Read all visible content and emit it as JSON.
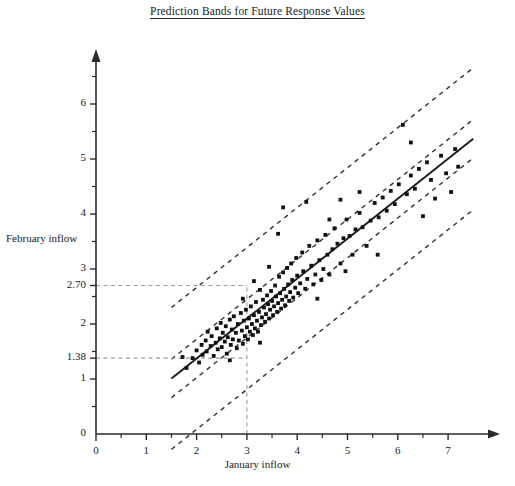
{
  "chart_data": {
    "type": "scatter",
    "title": "Prediction Bands for Future Response Values",
    "xlabel": "January inflow",
    "ylabel": "February inflow",
    "xlim": [
      0,
      7.6
    ],
    "ylim": [
      0,
      6.6
    ],
    "xticks": [
      0,
      1,
      2,
      3,
      4,
      5,
      6,
      7
    ],
    "xticklabels": [
      "0",
      "1",
      "2",
      "3",
      "4",
      "5",
      "6",
      "7"
    ],
    "xminor_ticks": [
      0.5,
      1.5,
      2.5,
      3.5,
      4.5,
      5.5,
      6.5
    ],
    "yticks": [
      0,
      1,
      2,
      3,
      4,
      5,
      6
    ],
    "yticklabels": [
      "0",
      "1",
      "2",
      "3",
      "4",
      "5",
      "6"
    ],
    "yminor_ticks": [
      0.5,
      1.5,
      2.5,
      3.5,
      4.5,
      5.5,
      6.5
    ],
    "grid": false,
    "legend": null,
    "annotations": [
      {
        "name": "upper-prediction-value",
        "label": "2.70",
        "y": 2.7,
        "x": 3.0
      },
      {
        "name": "lower-prediction-value",
        "label": "1.38",
        "y": 1.38,
        "x": 3.0
      },
      {
        "name": "query-x-value",
        "label": "3",
        "x": 3.0
      }
    ],
    "guide_lines": [
      {
        "name": "horizontal-guide-270",
        "type": "horizontal",
        "y": 2.7,
        "x_from": 0,
        "x_to": 3.0,
        "style": "dashed"
      },
      {
        "name": "horizontal-guide-138",
        "type": "horizontal",
        "y": 1.38,
        "x_from": 0,
        "x_to": 3.0,
        "style": "dashed"
      },
      {
        "name": "vertical-guide-3",
        "type": "vertical",
        "x": 3.0,
        "y_from": 0,
        "y_to": 2.7,
        "style": "dashed"
      }
    ],
    "fit_line": {
      "name": "regression-line",
      "style": "solid",
      "slope": 0.7262,
      "intercept": -0.0786,
      "x_from": 1.5,
      "x_to": 7.5,
      "y_from": 1.01,
      "y_to": 5.37
    },
    "bands": [
      {
        "name": "confidence-band-upper",
        "style": "dashed",
        "slope": 0.7262,
        "intercept": 0.2714,
        "x_from": 1.5,
        "x_to": 7.5
      },
      {
        "name": "confidence-band-lower",
        "style": "dashed",
        "slope": 0.7262,
        "intercept": -0.4286,
        "x_from": 1.5,
        "x_to": 7.5
      },
      {
        "name": "prediction-band-upper",
        "style": "dashed",
        "slope": 0.7262,
        "intercept": 1.2114,
        "x_from": 1.5,
        "x_to": 7.5
      },
      {
        "name": "prediction-band-lower",
        "style": "dashed",
        "slope": 0.7262,
        "intercept": -1.3686,
        "x_from": 1.5,
        "x_to": 7.5
      }
    ],
    "points": [
      [
        1.72,
        1.4
      ],
      [
        1.8,
        1.2
      ],
      [
        1.92,
        1.38
      ],
      [
        2.0,
        1.52
      ],
      [
        2.05,
        1.3
      ],
      [
        2.1,
        1.62
      ],
      [
        2.12,
        1.44
      ],
      [
        2.18,
        1.7
      ],
      [
        2.2,
        1.5
      ],
      [
        2.22,
        1.86
      ],
      [
        2.28,
        1.6
      ],
      [
        2.3,
        1.78
      ],
      [
        2.34,
        1.42
      ],
      [
        2.38,
        1.66
      ],
      [
        2.4,
        1.92
      ],
      [
        2.42,
        1.54
      ],
      [
        2.46,
        1.74
      ],
      [
        2.48,
        2.02
      ],
      [
        2.5,
        1.58
      ],
      [
        2.52,
        1.84
      ],
      [
        2.56,
        1.68
      ],
      [
        2.58,
        1.96
      ],
      [
        2.6,
        1.46
      ],
      [
        2.62,
        1.76
      ],
      [
        2.66,
        2.08
      ],
      [
        2.68,
        1.62
      ],
      [
        2.7,
        1.9
      ],
      [
        2.72,
        1.72
      ],
      [
        2.74,
        2.14
      ],
      [
        2.78,
        1.84
      ],
      [
        2.8,
        1.56
      ],
      [
        2.82,
        2.0
      ],
      [
        2.84,
        1.7
      ],
      [
        2.88,
        2.2
      ],
      [
        2.9,
        1.88
      ],
      [
        2.92,
        1.64
      ],
      [
        2.94,
        2.06
      ],
      [
        2.96,
        1.78
      ],
      [
        2.98,
        2.26
      ],
      [
        3.0,
        1.94
      ],
      [
        3.02,
        1.72
      ],
      [
        3.04,
        2.1
      ],
      [
        3.06,
        1.86
      ],
      [
        3.08,
        2.32
      ],
      [
        3.1,
        2.0
      ],
      [
        3.12,
        1.8
      ],
      [
        3.14,
        2.16
      ],
      [
        3.16,
        1.92
      ],
      [
        3.18,
        2.4
      ],
      [
        3.2,
        2.06
      ],
      [
        3.22,
        1.86
      ],
      [
        3.24,
        2.22
      ],
      [
        3.26,
        2.62
      ],
      [
        3.28,
        1.98
      ],
      [
        3.3,
        2.12
      ],
      [
        3.32,
        2.44
      ],
      [
        3.34,
        2.3
      ],
      [
        3.36,
        2.04
      ],
      [
        3.38,
        2.18
      ],
      [
        3.4,
        2.52
      ],
      [
        3.42,
        2.36
      ],
      [
        3.44,
        2.1
      ],
      [
        3.46,
        2.26
      ],
      [
        3.48,
        2.6
      ],
      [
        3.5,
        2.42
      ],
      [
        3.52,
        2.16
      ],
      [
        3.54,
        2.32
      ],
      [
        3.56,
        2.7
      ],
      [
        3.58,
        2.5
      ],
      [
        3.6,
        2.22
      ],
      [
        3.62,
        2.38
      ],
      [
        3.64,
        2.86
      ],
      [
        3.66,
        2.56
      ],
      [
        3.68,
        2.28
      ],
      [
        3.7,
        2.44
      ],
      [
        3.72,
        2.94
      ],
      [
        3.74,
        2.64
      ],
      [
        3.76,
        2.34
      ],
      [
        3.78,
        2.5
      ],
      [
        3.8,
        3.02
      ],
      [
        3.82,
        2.72
      ],
      [
        3.84,
        2.42
      ],
      [
        3.86,
        2.58
      ],
      [
        3.88,
        3.1
      ],
      [
        3.9,
        2.8
      ],
      [
        3.92,
        2.48
      ],
      [
        3.96,
        2.66
      ],
      [
        3.98,
        3.2
      ],
      [
        4.0,
        2.88
      ],
      [
        4.02,
        2.56
      ],
      [
        4.06,
        2.74
      ],
      [
        4.1,
        3.3
      ],
      [
        4.12,
        2.96
      ],
      [
        4.16,
        2.64
      ],
      [
        4.2,
        2.82
      ],
      [
        4.24,
        3.42
      ],
      [
        4.28,
        3.06
      ],
      [
        4.32,
        2.72
      ],
      [
        4.36,
        2.9
      ],
      [
        4.4,
        3.52
      ],
      [
        4.44,
        3.16
      ],
      [
        4.48,
        2.8
      ],
      [
        4.52,
        3.0
      ],
      [
        4.56,
        3.62
      ],
      [
        4.6,
        3.26
      ],
      [
        4.64,
        2.9
      ],
      [
        4.7,
        3.36
      ],
      [
        4.74,
        3.74
      ],
      [
        4.8,
        3.46
      ],
      [
        4.86,
        3.1
      ],
      [
        4.92,
        3.56
      ],
      [
        4.98,
        3.9
      ],
      [
        5.04,
        3.6
      ],
      [
        5.1,
        3.26
      ],
      [
        5.16,
        3.72
      ],
      [
        5.24,
        4.02
      ],
      [
        5.3,
        3.76
      ],
      [
        5.38,
        3.42
      ],
      [
        5.46,
        3.88
      ],
      [
        5.54,
        4.2
      ],
      [
        5.62,
        3.94
      ],
      [
        5.7,
        4.3
      ],
      [
        5.78,
        4.06
      ],
      [
        5.86,
        4.42
      ],
      [
        5.94,
        4.18
      ],
      [
        6.02,
        4.54
      ],
      [
        6.1,
        5.62
      ],
      [
        6.18,
        4.36
      ],
      [
        6.26,
        4.7
      ],
      [
        6.34,
        4.46
      ],
      [
        6.42,
        4.82
      ],
      [
        6.5,
        3.96
      ],
      [
        6.58,
        4.94
      ],
      [
        6.66,
        4.62
      ],
      [
        6.74,
        4.28
      ],
      [
        6.86,
        5.06
      ],
      [
        6.96,
        4.74
      ],
      [
        7.06,
        4.4
      ],
      [
        7.14,
        5.18
      ],
      [
        7.2,
        4.86
      ],
      [
        3.72,
        4.12
      ],
      [
        4.18,
        4.22
      ],
      [
        3.62,
        3.64
      ],
      [
        4.86,
        4.26
      ],
      [
        5.24,
        4.4
      ],
      [
        3.14,
        2.78
      ],
      [
        2.66,
        1.34
      ],
      [
        3.44,
        3.04
      ],
      [
        4.4,
        2.46
      ],
      [
        4.96,
        2.96
      ],
      [
        2.92,
        2.46
      ],
      [
        3.26,
        1.66
      ],
      [
        4.64,
        3.9
      ],
      [
        5.6,
        3.26
      ],
      [
        6.26,
        5.3
      ]
    ]
  }
}
